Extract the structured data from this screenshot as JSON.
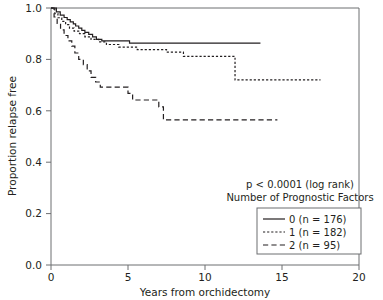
{
  "chart_data": {
    "type": "line",
    "title": "",
    "xlabel": "Years from orchidectomy",
    "ylabel": "Proportion relapse free",
    "xlim": [
      0,
      20
    ],
    "ylim": [
      0,
      1
    ],
    "xticks": [
      "0",
      "5",
      "10",
      "15",
      "20"
    ],
    "xtick_values": [
      0,
      5,
      10,
      15,
      20
    ],
    "yticks": [
      "0.0",
      "0.2",
      "0.4",
      "0.6",
      "0.8",
      "1.0"
    ],
    "ytick_values": [
      0,
      0.2,
      0.4,
      0.6,
      0.8,
      1.0
    ],
    "grid": false,
    "legend_position": "lower right",
    "annotations": [
      "p < 0.0001 (log rank)",
      "Number of Prognostic Factors"
    ],
    "series": [
      {
        "name": "0 (n = 176)",
        "group": "0",
        "n": 176,
        "linestyle": "solid",
        "color": "#231f20",
        "points": [
          [
            0.0,
            1.0
          ],
          [
            0.35,
            1.0
          ],
          [
            0.35,
            0.985
          ],
          [
            0.6,
            0.985
          ],
          [
            0.6,
            0.972
          ],
          [
            0.85,
            0.972
          ],
          [
            0.85,
            0.963
          ],
          [
            1.05,
            0.963
          ],
          [
            1.05,
            0.955
          ],
          [
            1.25,
            0.955
          ],
          [
            1.25,
            0.946
          ],
          [
            1.45,
            0.946
          ],
          [
            1.45,
            0.938
          ],
          [
            1.6,
            0.938
          ],
          [
            1.6,
            0.93
          ],
          [
            1.8,
            0.93
          ],
          [
            1.8,
            0.922
          ],
          [
            2.0,
            0.922
          ],
          [
            2.0,
            0.913
          ],
          [
            2.2,
            0.913
          ],
          [
            2.2,
            0.905
          ],
          [
            2.45,
            0.905
          ],
          [
            2.45,
            0.897
          ],
          [
            2.7,
            0.897
          ],
          [
            2.7,
            0.888
          ],
          [
            2.95,
            0.888
          ],
          [
            2.95,
            0.878
          ],
          [
            3.3,
            0.878
          ],
          [
            3.3,
            0.872
          ],
          [
            5.1,
            0.872
          ],
          [
            5.1,
            0.863
          ],
          [
            13.6,
            0.863
          ]
        ]
      },
      {
        "name": "1 (n = 182)",
        "group": "1",
        "n": 182,
        "linestyle": "dotted",
        "color": "#231f20",
        "points": [
          [
            0.0,
            1.0
          ],
          [
            0.25,
            1.0
          ],
          [
            0.25,
            0.978
          ],
          [
            0.45,
            0.978
          ],
          [
            0.45,
            0.962
          ],
          [
            0.7,
            0.962
          ],
          [
            0.7,
            0.948
          ],
          [
            0.95,
            0.948
          ],
          [
            0.95,
            0.935
          ],
          [
            1.2,
            0.935
          ],
          [
            1.2,
            0.922
          ],
          [
            1.5,
            0.922
          ],
          [
            1.5,
            0.91
          ],
          [
            1.85,
            0.91
          ],
          [
            1.85,
            0.9
          ],
          [
            2.2,
            0.9
          ],
          [
            2.2,
            0.888
          ],
          [
            2.6,
            0.888
          ],
          [
            2.6,
            0.878
          ],
          [
            3.1,
            0.878
          ],
          [
            3.1,
            0.868
          ],
          [
            3.6,
            0.868
          ],
          [
            3.6,
            0.858
          ],
          [
            4.4,
            0.858
          ],
          [
            4.4,
            0.848
          ],
          [
            5.6,
            0.848
          ],
          [
            5.6,
            0.838
          ],
          [
            7.5,
            0.838
          ],
          [
            7.5,
            0.828
          ],
          [
            8.6,
            0.828
          ],
          [
            8.6,
            0.812
          ],
          [
            11.95,
            0.812
          ],
          [
            11.95,
            0.72
          ],
          [
            17.5,
            0.72
          ]
        ]
      },
      {
        "name": "2 (n = 95)",
        "group": "2",
        "n": 95,
        "linestyle": "dashed",
        "color": "#231f20",
        "points": [
          [
            0.0,
            1.0
          ],
          [
            0.2,
            1.0
          ],
          [
            0.2,
            0.965
          ],
          [
            0.4,
            0.965
          ],
          [
            0.4,
            0.94
          ],
          [
            0.62,
            0.94
          ],
          [
            0.62,
            0.915
          ],
          [
            0.85,
            0.915
          ],
          [
            0.85,
            0.893
          ],
          [
            1.1,
            0.893
          ],
          [
            1.1,
            0.872
          ],
          [
            1.35,
            0.872
          ],
          [
            1.35,
            0.852
          ],
          [
            1.55,
            0.852
          ],
          [
            1.55,
            0.825
          ],
          [
            1.8,
            0.825
          ],
          [
            1.8,
            0.8
          ],
          [
            2.1,
            0.8
          ],
          [
            2.1,
            0.78
          ],
          [
            2.35,
            0.78
          ],
          [
            2.35,
            0.755
          ],
          [
            2.6,
            0.755
          ],
          [
            2.6,
            0.73
          ],
          [
            2.9,
            0.73
          ],
          [
            2.9,
            0.712
          ],
          [
            3.2,
            0.712
          ],
          [
            3.2,
            0.692
          ],
          [
            5.0,
            0.692
          ],
          [
            5.0,
            0.668
          ],
          [
            5.3,
            0.668
          ],
          [
            5.3,
            0.642
          ],
          [
            7.0,
            0.642
          ],
          [
            7.0,
            0.615
          ],
          [
            7.3,
            0.615
          ],
          [
            7.3,
            0.565
          ],
          [
            14.7,
            0.565
          ]
        ]
      }
    ]
  },
  "annotation": {
    "pvalue_text": "p < 0.0001 (log rank)",
    "subtitle_text": "Number of Prognostic Factors"
  },
  "legend": {
    "entries": [
      {
        "label": "0 (n = 176)",
        "style": "solid"
      },
      {
        "label": "1 (n = 182)",
        "style": "dotted"
      },
      {
        "label": "2 (n = 95)",
        "style": "dashed"
      }
    ]
  },
  "axes": {
    "y_title": "Proportion relapse free",
    "x_title": "Years from orchidectomy",
    "y_labels": [
      "1.0",
      "0.8",
      "0.6",
      "0.4",
      "0.2",
      "0.0"
    ],
    "x_labels": [
      "0",
      "5",
      "10",
      "15",
      "20"
    ]
  }
}
